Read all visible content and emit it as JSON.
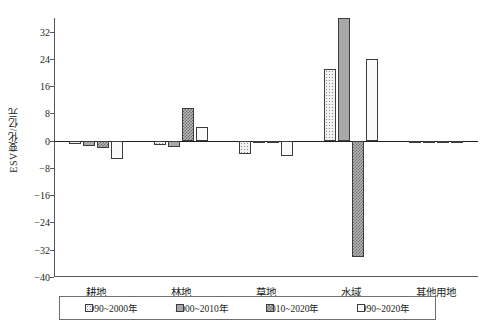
{
  "chart_data": {
    "type": "bar",
    "title": "",
    "xlabel": "",
    "ylabel": "ESV变化/亿元",
    "ylim": [
      -40,
      36
    ],
    "yticks": [
      32,
      24,
      16,
      8,
      0,
      -8,
      -16,
      -24,
      -32,
      -40
    ],
    "ytick_labels": [
      "32",
      "24",
      "16",
      "8",
      "0",
      "−8",
      "−16",
      "−24",
      "−32",
      "−40"
    ],
    "grid": false,
    "legend_position": "bottom",
    "categories": [
      "耕地",
      "林地",
      "草地",
      "水域",
      "其他用地"
    ],
    "series": [
      {
        "name": "1990~2000年",
        "pattern": "light-stipple",
        "values": [
          -1.0,
          -1.4,
          -3.8,
          21.0,
          -0.3
        ]
      },
      {
        "name": "2000~2010年",
        "pattern": "solid-gray",
        "values": [
          -1.6,
          -1.9,
          -0.7,
          36.0,
          -0.2
        ]
      },
      {
        "name": "2010~2020年",
        "pattern": "dark-checker",
        "values": [
          -2.2,
          9.6,
          -0.8,
          -34.0,
          -0.4
        ]
      },
      {
        "name": "1990~2020年",
        "pattern": "white-dots",
        "values": [
          -5.3,
          4.0,
          -4.6,
          24.0,
          -0.5
        ]
      }
    ]
  },
  "legend": {
    "items": [
      {
        "label": "1990~2000年",
        "pattern": "light-stipple"
      },
      {
        "label": "2000~2010年",
        "pattern": "solid-gray"
      },
      {
        "label": "2010~2020年",
        "pattern": "dark-checker"
      },
      {
        "label": "1990~2020年",
        "pattern": "white-dots"
      }
    ]
  },
  "colors": {
    "axis": "#58585a",
    "zero_line": "#231f20",
    "bar_outline": "#3c3c3c",
    "series_1990_2000": "#f2f2f2",
    "series_2000_2010": "#a8a8a8",
    "series_2010_2020": "#b9b9b9",
    "series_1990_2020": "#fafafa"
  }
}
